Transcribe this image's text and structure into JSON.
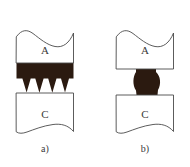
{
  "figure": {
    "background_color": "#ffffff",
    "outline_color": "#4a4a4a",
    "bond_color": "#2b1a10",
    "label_color": "#3a3a3a",
    "width": 190,
    "height": 167
  },
  "panels": [
    {
      "id": "a",
      "caption": "a)",
      "caption_x": 45,
      "caption_y": 150,
      "bond_type": "jagged-sawtooth",
      "spike_count": 4,
      "upper_block": {
        "label": "A",
        "label_x": 45,
        "label_y": 51,
        "left": 16,
        "right": 74,
        "top": 31,
        "bottom": 63,
        "top_edge": "wavy"
      },
      "lower_block": {
        "label": "C",
        "label_x": 45,
        "label_y": 115,
        "left": 16,
        "right": 74,
        "top": 93,
        "bottom": 133,
        "bottom_edge": "wavy"
      },
      "bond_region": {
        "top": 63,
        "band_bottom": 78,
        "spike_tip": 93,
        "left": 16,
        "right": 74
      }
    },
    {
      "id": "b",
      "caption": "b)",
      "caption_x": 145,
      "caption_y": 150,
      "bond_type": "narrow-neck",
      "spike_count": 0,
      "upper_block": {
        "label": "A",
        "label_x": 145,
        "label_y": 51,
        "left": 116,
        "right": 174,
        "top": 31,
        "bottom": 69,
        "top_edge": "wavy"
      },
      "lower_block": {
        "label": "C",
        "label_x": 145,
        "label_y": 115,
        "left": 116,
        "right": 174,
        "top": 93,
        "bottom": 133,
        "bottom_edge": "wavy"
      },
      "bond_region": {
        "top": 69,
        "bottom": 95,
        "neck_left": 135,
        "neck_right": 157,
        "bulge": 5
      }
    }
  ]
}
